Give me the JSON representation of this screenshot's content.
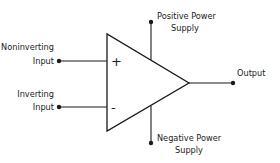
{
  "diagram": {
    "symbol": "op-amp triangle",
    "colors": {
      "stroke": "#1a1a1a",
      "text": "#222222",
      "background": "#ffffff"
    },
    "terminals": {
      "noninverting": {
        "line1": "Noninverting",
        "line2": "Input",
        "sign": "+"
      },
      "inverting": {
        "line1": "Inverting",
        "line2": "Input",
        "sign": "-"
      },
      "output": {
        "label": "Output"
      },
      "positive_supply": {
        "line1": "Positive Power",
        "line2": "Supply"
      },
      "negative_supply": {
        "line1": "Negative Power",
        "line2": "Supply"
      }
    }
  }
}
